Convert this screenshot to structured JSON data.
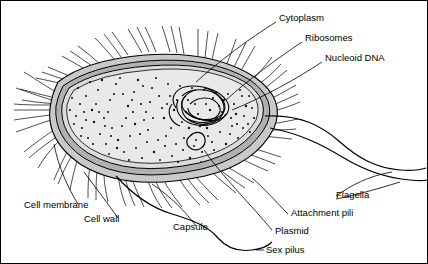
{
  "figure": {
    "background_color": "#ffffff",
    "line_color": "#000000",
    "cytoplasm_fill": "#e8e8e8",
    "envelope_fill": "#b8b8b8",
    "capsule_fill": "#d0d0d0"
  },
  "labels": [
    {
      "id": "cytoplasm",
      "text": "Cytoplasm"
    },
    {
      "id": "ribosomes",
      "text": "Ribosomes"
    },
    {
      "id": "nucleoid-dna",
      "text": "Nucleoid DNA"
    },
    {
      "id": "flagella",
      "text": "Flagella"
    },
    {
      "id": "attachment-pili",
      "text": "Attachment pili"
    },
    {
      "id": "plasmid",
      "text": "Plasmid"
    },
    {
      "id": "sex-pilus",
      "text": "Sex pilus"
    },
    {
      "id": "capsule",
      "text": "Capsule"
    },
    {
      "id": "cell-wall",
      "text": "Cell wall"
    },
    {
      "id": "cell-membrane",
      "text": "Cell membrane"
    }
  ]
}
